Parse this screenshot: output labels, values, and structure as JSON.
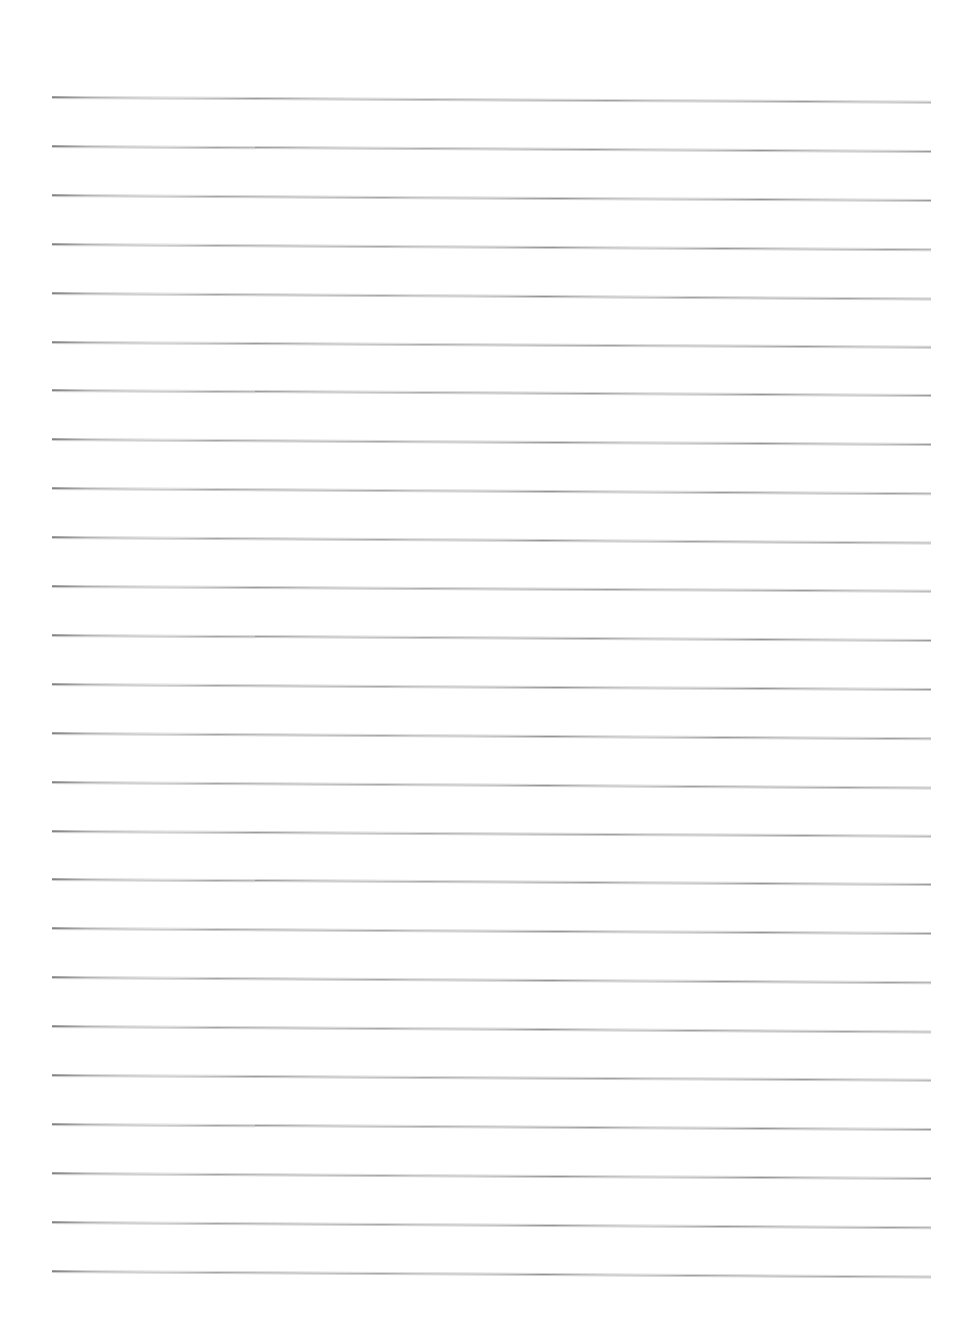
{
  "document": {
    "kind": "scanned-lined-paper",
    "title": "Blank ruled notebook page",
    "page_width": 968,
    "page_height": 1327,
    "background_color": "#ffffff",
    "text_content": "",
    "handwriting_present": "no",
    "printed_text_present": "no"
  },
  "ruling": {
    "line_count": 25,
    "line_color": "#8c8c8c",
    "line_halo_color": "#cfcfcf",
    "line_thickness_px": 1,
    "left_margin_px": 52,
    "right_end_px": 931,
    "line_length_px": 879,
    "first_line_y_px": 96,
    "last_line_y_px": 1270,
    "line_spacing_px": 48.9,
    "scan_skew_degrees": 0.33,
    "skew_direction": "down-to-the-right",
    "margin_rule_present": "no",
    "holes_present": "no",
    "lines_y": [
      96,
      144.9,
      193.8,
      242.7,
      291.6,
      340.5,
      389.4,
      438.3,
      487.2,
      536.1,
      585,
      633.9,
      682.8,
      731.7,
      780.6,
      829.5,
      878.4,
      927.3,
      976.2,
      1025.1,
      1074,
      1122.9,
      1171.8,
      1220.7,
      1269.6
    ]
  }
}
